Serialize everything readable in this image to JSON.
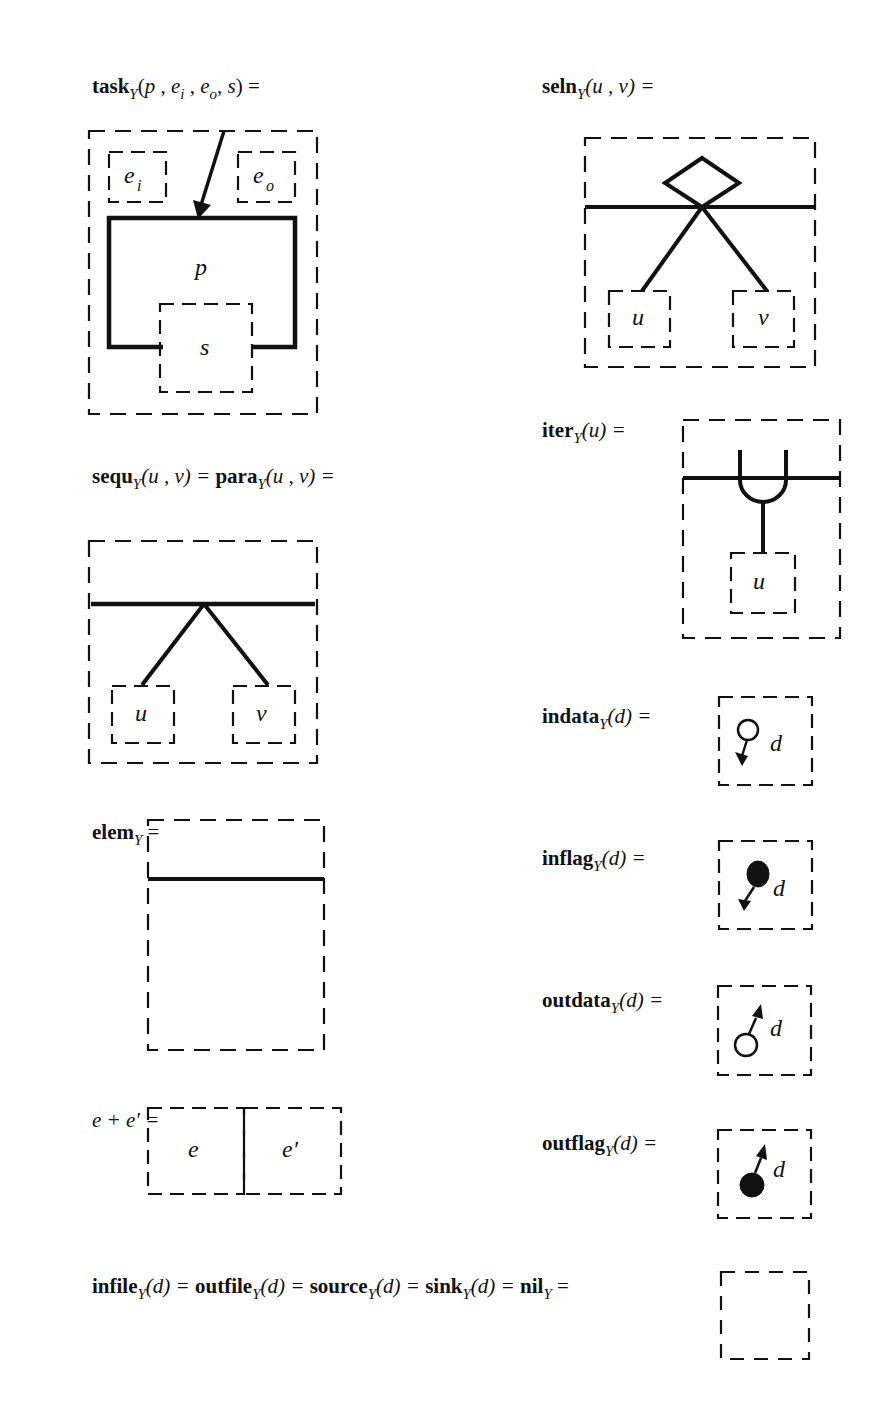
{
  "figure": {
    "ink_color": "#111111",
    "background": "#ffffff",
    "subscript": "Y",
    "definitions": [
      {
        "id": "task",
        "name": "task",
        "args": [
          "p",
          "e",
          "e",
          "s"
        ],
        "arg_subscripts": [
          "",
          "i",
          "o",
          ""
        ],
        "label_parts": {
          "name": "task",
          "sub": "Y",
          "open": "(",
          "a1": "p",
          "sep1": " , ",
          "a2": "e",
          "a2sub": "i",
          "sep2": " , ",
          "a3": "e",
          "a3sub": "o",
          "sep3": ", ",
          "a4": "s",
          "close": ") ="
        },
        "diagram": {
          "inner_boxes": [
            "e_i",
            "e_o",
            "s"
          ],
          "solid_frame_label": "p",
          "arrow": "incoming-arrow"
        }
      },
      {
        "id": "seln",
        "label_parts": {
          "name": "seln",
          "sub": "Y",
          "args": "(u , v) ="
        },
        "diagram": {
          "symbol": "diamond",
          "children": [
            "u",
            "v"
          ]
        }
      },
      {
        "id": "iter",
        "label_parts": {
          "name": "iter",
          "sub": "Y",
          "args": "(u) ="
        },
        "diagram": {
          "symbol": "loop-fork",
          "children": [
            "u"
          ]
        }
      },
      {
        "id": "sequ-para",
        "label_parts": {
          "name1": "sequ",
          "sub": "Y",
          "args1": "(u , v) = ",
          "name2": "para",
          "args2": "(u , v) ="
        },
        "diagram": {
          "symbol": "fork",
          "children": [
            "u",
            "v"
          ]
        }
      },
      {
        "id": "indata",
        "label_parts": {
          "name": "indata",
          "sub": "Y",
          "args": "(d) ="
        },
        "diagram": {
          "symbol": "hollow-circle-arrow-down",
          "var": "d"
        }
      },
      {
        "id": "inflag",
        "label_parts": {
          "name": "inflag",
          "sub": "Y",
          "args": "(d) ="
        },
        "diagram": {
          "symbol": "filled-circle-arrow-down",
          "var": "d"
        }
      },
      {
        "id": "elem",
        "label_parts": {
          "name": "elem",
          "sub": "Y",
          "args": " ="
        },
        "diagram": {
          "symbol": "empty-element"
        }
      },
      {
        "id": "outdata",
        "label_parts": {
          "name": "outdata",
          "sub": "Y",
          "args": "(d) ="
        },
        "diagram": {
          "symbol": "hollow-circle-arrow-up",
          "var": "d"
        }
      },
      {
        "id": "concat",
        "label_parts": {
          "lhs": "e + e′ ="
        },
        "diagram": {
          "cells": [
            "e",
            "e′"
          ]
        }
      },
      {
        "id": "outflag",
        "label_parts": {
          "name": "outflag",
          "sub": "Y",
          "args": "(d) ="
        },
        "diagram": {
          "symbol": "filled-circle-arrow-up",
          "var": "d"
        }
      },
      {
        "id": "nil",
        "label_parts": {
          "n1": "infile",
          "a1": "(d) = ",
          "n2": "outfile",
          "a2": "(d) = ",
          "n3": "source",
          "a3": "(d) = ",
          "n4": "sink",
          "a4": "(d) = ",
          "n5": "nil",
          "a5": " =",
          "sub": "Y"
        },
        "diagram": {
          "symbol": "empty-box"
        }
      }
    ],
    "box_labels": {
      "e_i": "e",
      "e_i_sub": "i",
      "e_o": "e",
      "e_o_sub": "o",
      "p": "p",
      "s": "s",
      "u": "u",
      "v": "v",
      "d": "d",
      "e": "e",
      "e_prime": "e′"
    }
  }
}
